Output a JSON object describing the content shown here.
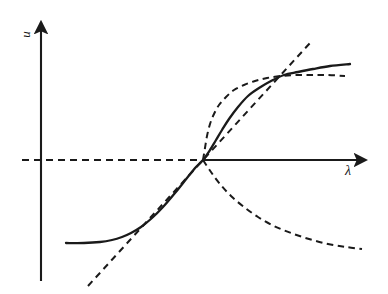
{
  "figure": {
    "background_color": "#ffffff",
    "ink_color": "#1a1a1a"
  },
  "axes": {
    "y_axis": {
      "label": "u",
      "name": "vertical-axis",
      "orientation": "vertical",
      "arrow": "up",
      "x_px": 41,
      "top_px": 18,
      "bottom_px": 281
    },
    "x_axis": {
      "label": "λ",
      "name": "horizontal-axis",
      "orientation": "horizontal",
      "arrow": "right",
      "y_px": 160,
      "left_px": 22,
      "right_px": 372
    }
  },
  "chart_data": {
    "type": "line",
    "xlabel": "λ",
    "ylabel": "u",
    "grid": false,
    "legend": "none",
    "origin_px": {
      "x": 203,
      "y": 160
    },
    "xlim": [
      22,
      372
    ],
    "ylim": [
      18,
      281
    ],
    "branch_point_label": "transcritical bifurcation point",
    "series": [
      {
        "name": "trivial-branch-stable-right",
        "style": "solid",
        "description": "horizontal axis continuation to the right of the bifurcation point (stable trivial solution)",
        "points_px": [
          [
            203,
            160
          ],
          [
            372,
            160
          ]
        ]
      },
      {
        "name": "trivial-branch-unstable-left",
        "style": "dashed",
        "description": "horizontal axis continuation to the left of the bifurcation point (unstable trivial solution)",
        "points_px": [
          [
            22,
            160
          ],
          [
            203,
            160
          ]
        ]
      },
      {
        "name": "solid-solution-branch",
        "style": "solid",
        "description": "S-shaped stable solution branch rising through the bifurcation point and saturating on the right, flattening on the lower left",
        "points_px": [
          [
            66,
            243
          ],
          [
            84,
            243
          ],
          [
            100,
            242
          ],
          [
            112,
            240
          ],
          [
            122,
            237
          ],
          [
            131,
            233
          ],
          [
            141,
            227
          ],
          [
            152,
            218
          ],
          [
            163,
            207
          ],
          [
            175,
            193
          ],
          [
            187,
            178
          ],
          [
            196,
            167
          ],
          [
            203,
            160
          ],
          [
            210,
            150
          ],
          [
            216,
            140
          ],
          [
            222,
            130
          ],
          [
            229,
            119
          ],
          [
            238,
            107
          ],
          [
            248,
            96
          ],
          [
            259,
            88
          ],
          [
            271,
            81
          ],
          [
            284,
            75
          ],
          [
            298,
            72
          ],
          [
            313,
            69
          ],
          [
            330,
            66
          ],
          [
            350,
            64
          ]
        ]
      },
      {
        "name": "dashed-upper-branch",
        "style": "dashed",
        "description": "dashed curve leaving the bifurcation point steeply upward, bending over and meeting the solid branch at the crossing point, then continuing as a nearly horizontal dashed asymptote",
        "points_px": [
          [
            203,
            160
          ],
          [
            205,
            148
          ],
          [
            207,
            136
          ],
          [
            210,
            124
          ],
          [
            214,
            114
          ],
          [
            219,
            105
          ],
          [
            226,
            97
          ],
          [
            234,
            90
          ],
          [
            244,
            85
          ],
          [
            255,
            81
          ],
          [
            267,
            78
          ],
          [
            281,
            76
          ],
          [
            296,
            75
          ],
          [
            312,
            75
          ],
          [
            328,
            75
          ],
          [
            345,
            76
          ]
        ]
      },
      {
        "name": "dashed-straight-branch",
        "style": "dashed",
        "description": "straight dashed line of positive slope passing through the bifurcation point, extending to the lower left past the knee of the solid branch and to the upper right past the crossing point",
        "points_px": [
          [
            88,
            286
          ],
          [
            203,
            160
          ],
          [
            310,
            43
          ]
        ]
      },
      {
        "name": "dashed-lower-branch",
        "style": "dashed",
        "description": "dashed curve descending from the bifurcation point to the lower right (unstable branch)",
        "points_px": [
          [
            203,
            160
          ],
          [
            211,
            172
          ],
          [
            220,
            184
          ],
          [
            231,
            196
          ],
          [
            244,
            207
          ],
          [
            258,
            217
          ],
          [
            274,
            226
          ],
          [
            291,
            233
          ],
          [
            309,
            239
          ],
          [
            328,
            244
          ],
          [
            346,
            247
          ],
          [
            362,
            249
          ]
        ]
      }
    ],
    "crossing_points_px": [
      {
        "name": "bifurcation-point",
        "x": 203,
        "y": 160
      },
      {
        "name": "upper-right-crossing",
        "x": 288,
        "y": 75
      },
      {
        "name": "lower-left-knee",
        "x": 130,
        "y": 234
      }
    ]
  }
}
